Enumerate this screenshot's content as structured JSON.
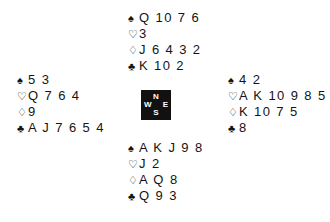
{
  "diagram": {
    "type": "bridge-hand-diagram",
    "background_color": "#ffffff",
    "text_color": "#141414"
  },
  "suits": {
    "spades": {
      "symbol": "♠",
      "name": "spade-icon"
    },
    "hearts": {
      "symbol": "♡",
      "name": "heart-icon"
    },
    "diamonds": {
      "symbol": "♢",
      "name": "diamond-icon"
    },
    "clubs": {
      "symbol": "♣",
      "name": "club-icon"
    }
  },
  "compass": {
    "box_color": "#111111",
    "label_color": "#ffffff",
    "north": "N",
    "west": "W",
    "east": "E",
    "south": "S"
  },
  "hands": {
    "north": {
      "position": "North",
      "spades": "Q 10 7 6",
      "hearts": "3",
      "diamonds": "J 6 4 3 2",
      "clubs": "K 10 2"
    },
    "west": {
      "position": "West",
      "spades": "5 3",
      "hearts": "Q 7 6 4",
      "diamonds": "9",
      "clubs": "A J 7 6 5 4"
    },
    "east": {
      "position": "East",
      "spades": "4 2",
      "hearts": "A K 10 9 8 5",
      "diamonds": "K 10 7 5",
      "clubs": "8"
    },
    "south": {
      "position": "South",
      "spades": "A K J 9 8",
      "hearts": "J 2",
      "diamonds": "A Q 8",
      "clubs": "Q 9 3"
    }
  }
}
